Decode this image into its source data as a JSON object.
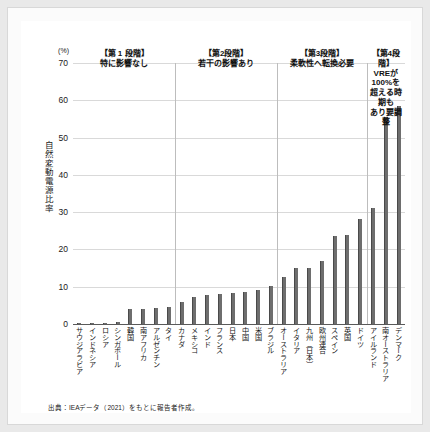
{
  "chart_data": {
    "type": "bar",
    "title": "",
    "xlabel": "",
    "ylabel": "自然変動電源比率",
    "yunit": "(%)",
    "ylim": [
      0,
      70
    ],
    "yticks": [
      0,
      10,
      20,
      30,
      40,
      50,
      60,
      70
    ],
    "grid": true,
    "legend": "none",
    "bar_color": "#6e6e6e",
    "categories": [
      "サウジアラビア",
      "インドネシア",
      "ロシア",
      "シンガポール",
      "韓国",
      "南アフリカ",
      "アルゼンチン",
      "タイ",
      "カナダ",
      "メキシコ",
      "インド",
      "フランス",
      "日本",
      "中国",
      "米国",
      "ブラジル",
      "オーストラリア",
      "イタリア",
      "九州（日本）",
      "欧州連合",
      "スペイン",
      "英国",
      "ドイツ",
      "アイルランド",
      "南オーストラリア",
      "デンマーク"
    ],
    "values": [
      0.1,
      0.2,
      0.3,
      0.6,
      4.0,
      4.1,
      4.3,
      4.6,
      6.0,
      7.3,
      7.7,
      8.1,
      8.2,
      8.5,
      9.2,
      10.1,
      12.6,
      15.0,
      15.0,
      16.8,
      23.6,
      23.9,
      28.2,
      31.2,
      55.4,
      58.4
    ]
  },
  "stages": [
    {
      "id": "stage-1",
      "title": "【第 1 段階】",
      "subtitle": "特に影響なし",
      "start_index": 0,
      "end_index": 7
    },
    {
      "id": "stage-2",
      "title": "【第2段階】",
      "subtitle": "若干の影響あり",
      "start_index": 8,
      "end_index": 15
    },
    {
      "id": "stage-3",
      "title": "【第3段階】",
      "subtitle": "柔軟性へ転換必要",
      "start_index": 16,
      "end_index": 22
    },
    {
      "id": "stage-4",
      "title": "【第4段階】",
      "subtitle": "VREが\n100%を\n超える時期も\nあり要調整",
      "start_index": 23,
      "end_index": 25
    }
  ],
  "source": {
    "text": "出典：IEAデータ（2021）をもとに報告者作成。"
  },
  "colors": {
    "bar": "#6e6e6e",
    "bar_edge": "#4a4a4a",
    "gridline": "#d9d9d9",
    "axis": "#5a5a5a",
    "separator": "#bdbdbd",
    "page_background": "#e9e9e9",
    "panel_background": "#ffffff"
  }
}
